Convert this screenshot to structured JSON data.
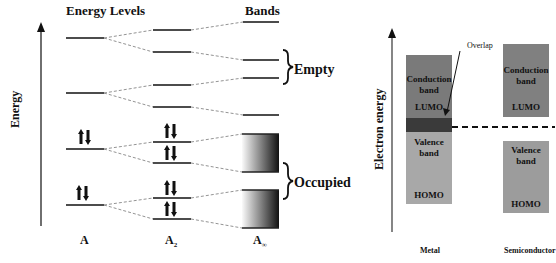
{
  "left_diagram": {
    "title": "Energy Levels",
    "bands_title": "Bands",
    "axis_label": "Energy",
    "empty_label": "Empty",
    "occupied_label": "Occupied",
    "columns": [
      {
        "label": "A",
        "sub": ""
      },
      {
        "label": "A",
        "sub": "2"
      },
      {
        "label": "A",
        "sub": "∞"
      }
    ]
  },
  "right_diagram": {
    "axis_label": "Electron energy",
    "overlap_label": "Overlap",
    "metal": {
      "label": "Metal",
      "conduction": "Conduction band",
      "lumo": "LUMO",
      "valence": "Valence band",
      "homo": "HOMO"
    },
    "semiconductor": {
      "label": "Semiconductor",
      "conduction": "Conduction band",
      "lumo": "LUMO",
      "valence": "Valence band",
      "homo": "HOMO"
    },
    "colors": {
      "conduction": "#7a7a7a",
      "overlap": "#3a3a3a",
      "valence": "#a8a8a8",
      "semi_conduction": "#808080",
      "semi_valence": "#9c9c9c"
    }
  }
}
